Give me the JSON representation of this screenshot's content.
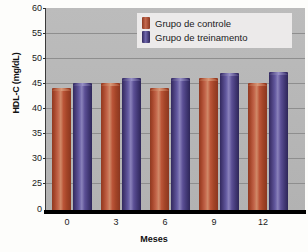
{
  "chart_data": {
    "type": "bar",
    "title": "",
    "xlabel": "Meses",
    "ylabel": "HDL-C (mg/dL)",
    "categories": [
      "0",
      "3",
      "6",
      "9",
      "12"
    ],
    "series": [
      {
        "name": "Grupo de controle",
        "color": "#b5543a",
        "values": [
          44,
          45,
          44,
          46,
          45
        ]
      },
      {
        "name": "Grupo de treinamento",
        "color": "#5a4f8f",
        "values": [
          45,
          46,
          46,
          47,
          47.2
        ]
      }
    ],
    "ylim": [
      0,
      60
    ],
    "y_ticks": [
      0,
      25,
      30,
      35,
      40,
      45,
      50,
      55,
      60
    ],
    "y_axis_broken": true,
    "grid": true,
    "legend_position": "top-center",
    "plot_background": "#b8b8b8"
  },
  "axes": {
    "y_title": "HDL-C (mg/dL)",
    "x_title": "Meses",
    "y_tick_labels": [
      "60",
      "55",
      "50",
      "45",
      "40",
      "35",
      "30",
      "25",
      "0"
    ],
    "x_tick_labels": [
      "0",
      "3",
      "6",
      "9",
      "12"
    ]
  },
  "legend": {
    "items": [
      {
        "label": "Grupo de controle",
        "swatch": "control-color-swatch"
      },
      {
        "label": "Grupo de treinamento",
        "swatch": "training-color-swatch"
      }
    ]
  }
}
